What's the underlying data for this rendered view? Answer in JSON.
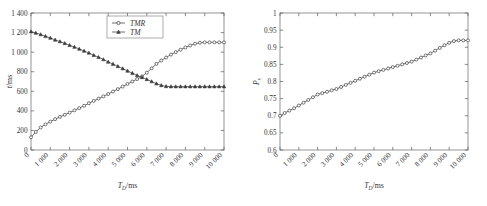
{
  "figure": {
    "background": "#ffffff",
    "line_color": "#4c4c4c",
    "frame_color": "#7a7a7a"
  },
  "chart_data": [
    {
      "type": "line",
      "panel": "left",
      "title": "",
      "xlabel_symbol": "T",
      "xlabel_sub": "D",
      "xlabel_unit": "/ms",
      "ylabel_symbol": "t",
      "ylabel_unit": "/ms",
      "xlim": [
        0,
        10000
      ],
      "ylim": [
        0,
        1400
      ],
      "xticks": [
        0,
        1000,
        2000,
        3000,
        4000,
        5000,
        6000,
        7000,
        8000,
        9000,
        10000
      ],
      "xticklabels": [
        "0",
        "1 000",
        "2 000",
        "3 000",
        "4 000",
        "5 000",
        "6 000",
        "7 000",
        "8 000",
        "9 000",
        "10 000"
      ],
      "yticks": [
        0,
        200,
        400,
        600,
        800,
        1000,
        1200,
        1400
      ],
      "yticklabels": [
        "0",
        "200",
        "400",
        "600",
        "800",
        "1 000",
        "1 200",
        "1 400"
      ],
      "grid": false,
      "legend_position": "top-center",
      "series": [
        {
          "name": "TMR",
          "marker": "circle",
          "x": [
            0,
            250,
            500,
            750,
            1000,
            1250,
            1500,
            1750,
            2000,
            2250,
            2500,
            2750,
            3000,
            3250,
            3500,
            3750,
            4000,
            4250,
            4500,
            4750,
            5000,
            5250,
            5500,
            5750,
            6000,
            6250,
            6500,
            6750,
            7000,
            7250,
            7500,
            7750,
            8000,
            8250,
            8500,
            8750,
            9000,
            9250,
            9500,
            9750,
            10000
          ],
          "y": [
            130,
            185,
            230,
            262,
            290,
            315,
            338,
            360,
            382,
            405,
            428,
            452,
            478,
            502,
            525,
            548,
            572,
            598,
            622,
            648,
            675,
            700,
            725,
            752,
            790,
            835,
            880,
            915,
            945,
            975,
            1000,
            1025,
            1048,
            1068,
            1086,
            1096,
            1100,
            1100,
            1100,
            1100,
            1100
          ]
        },
        {
          "name": "TM",
          "marker": "triangle",
          "x": [
            0,
            250,
            500,
            750,
            1000,
            1250,
            1500,
            1750,
            2000,
            2250,
            2500,
            2750,
            3000,
            3250,
            3500,
            3750,
            4000,
            4250,
            4500,
            4750,
            5000,
            5250,
            5500,
            5750,
            6000,
            6250,
            6500,
            6750,
            7000,
            7250,
            7500,
            7750,
            8000,
            8250,
            8500,
            8750,
            9000,
            9250,
            9500,
            9750,
            10000
          ],
          "y": [
            1210,
            1196,
            1180,
            1162,
            1145,
            1125,
            1108,
            1090,
            1070,
            1052,
            1032,
            1012,
            992,
            968,
            948,
            925,
            900,
            878,
            855,
            832,
            808,
            785,
            762,
            742,
            722,
            700,
            678,
            660,
            650,
            648,
            648,
            648,
            648,
            648,
            648,
            648,
            648,
            648,
            648,
            648,
            648
          ]
        }
      ]
    },
    {
      "type": "line",
      "panel": "right",
      "title": "",
      "xlabel_symbol": "T",
      "xlabel_sub": "D",
      "xlabel_unit": "/ms",
      "ylabel_symbol": "P",
      "ylabel_sub": "s",
      "ylabel_unit": "",
      "xlim": [
        0,
        10000
      ],
      "ylim": [
        0.6,
        1.0
      ],
      "xticks": [
        0,
        1000,
        2000,
        3000,
        4000,
        5000,
        6000,
        7000,
        8000,
        9000,
        10000
      ],
      "xticklabels": [
        "0",
        "1 000",
        "2 000",
        "3 000",
        "4 000",
        "5 000",
        "6 000",
        "7 000",
        "8 000",
        "9 000",
        "10 000"
      ],
      "yticks": [
        0.6,
        0.65,
        0.7,
        0.75,
        0.8,
        0.85,
        0.9,
        0.95,
        1.0
      ],
      "yticklabels": [
        "0.6",
        "0.65",
        "0.7",
        "0.75",
        "0.8",
        "0.85",
        "0.9",
        "0.95",
        "1"
      ],
      "grid": false,
      "legend_position": "none",
      "series": [
        {
          "name": "Ps",
          "marker": "circle",
          "x": [
            0,
            250,
            500,
            750,
            1000,
            1250,
            1500,
            1750,
            2000,
            2250,
            2500,
            2750,
            3000,
            3250,
            3500,
            3750,
            4000,
            4250,
            4500,
            4750,
            5000,
            5250,
            5500,
            5750,
            6000,
            6250,
            6500,
            6750,
            7000,
            7250,
            7500,
            7750,
            8000,
            8250,
            8500,
            8750,
            9000,
            9250,
            9500,
            9750,
            10000
          ],
          "y": [
            0.7,
            0.708,
            0.715,
            0.722,
            0.73,
            0.738,
            0.746,
            0.754,
            0.762,
            0.766,
            0.77,
            0.774,
            0.778,
            0.784,
            0.79,
            0.796,
            0.802,
            0.808,
            0.814,
            0.82,
            0.826,
            0.83,
            0.834,
            0.838,
            0.842,
            0.846,
            0.85,
            0.854,
            0.858,
            0.864,
            0.87,
            0.876,
            0.882,
            0.89,
            0.898,
            0.906,
            0.913,
            0.918,
            0.92,
            0.92,
            0.92
          ]
        }
      ]
    }
  ]
}
